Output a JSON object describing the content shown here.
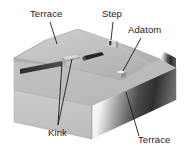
{
  "figure": {
    "background_color": "#ffffff"
  },
  "labels": {
    "terrace_top": "Terrace",
    "step": "Step",
    "adatom": "Adatom",
    "kink": "Kink",
    "terrace_bottom": "Terrace"
  },
  "colors": {
    "line": "#1b1b1b",
    "text": "#1b1b1b",
    "top_face_light": "#cfcfcf",
    "top_face_mid": "#b9b9b9",
    "top_face_dark": "#a8a8a8",
    "front_face": "#c6c6c6",
    "left_face": "#b2b2b2",
    "shadow_dark": "#3a3a3a",
    "highlight": "#ffffff"
  },
  "features": {
    "adatom_marker": "small-cube",
    "step_marker": "small-notch",
    "kink_markers": "two-ledge-notches"
  }
}
